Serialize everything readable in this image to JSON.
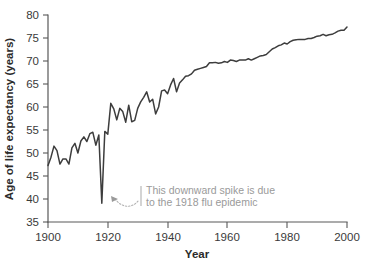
{
  "chart_data": {
    "type": "line",
    "title": "",
    "xlabel": "Year",
    "ylabel": "Age of life expectancy (years)",
    "xlim": [
      1900,
      2000
    ],
    "ylim": [
      35,
      80
    ],
    "grid": false,
    "legend": "none",
    "xticks": [
      1900,
      1920,
      1940,
      1960,
      1980,
      2000
    ],
    "yticks": [
      35,
      40,
      45,
      50,
      55,
      60,
      65,
      70,
      75,
      80
    ],
    "xtick_labels": [
      "1900",
      "1920",
      "1940",
      "1960",
      "1980",
      "2000"
    ],
    "ytick_labels": [
      "35",
      "40",
      "45",
      "50",
      "55",
      "60",
      "65",
      "70",
      "75",
      "80"
    ],
    "series": [
      {
        "name": "Life expectancy",
        "color": "#3d3d3d",
        "x": [
          1900,
          1901,
          1902,
          1903,
          1904,
          1905,
          1906,
          1907,
          1908,
          1909,
          1910,
          1911,
          1912,
          1913,
          1914,
          1915,
          1916,
          1917,
          1918,
          1919,
          1920,
          1921,
          1922,
          1923,
          1924,
          1925,
          1926,
          1927,
          1928,
          1929,
          1930,
          1931,
          1932,
          1933,
          1934,
          1935,
          1936,
          1937,
          1938,
          1939,
          1940,
          1941,
          1942,
          1943,
          1944,
          1945,
          1946,
          1947,
          1948,
          1949,
          1950,
          1951,
          1952,
          1953,
          1954,
          1955,
          1956,
          1957,
          1958,
          1959,
          1960,
          1961,
          1962,
          1963,
          1964,
          1965,
          1966,
          1967,
          1968,
          1969,
          1970,
          1971,
          1972,
          1973,
          1974,
          1975,
          1976,
          1977,
          1978,
          1979,
          1980,
          1981,
          1982,
          1983,
          1984,
          1985,
          1986,
          1987,
          1988,
          1989,
          1990,
          1991,
          1992,
          1993,
          1994,
          1995,
          1996,
          1997,
          1998,
          1999,
          2000
        ],
        "y": [
          47.3,
          49.1,
          51.5,
          50.5,
          47.6,
          48.7,
          48.7,
          47.6,
          51.1,
          52.1,
          50.0,
          52.6,
          53.5,
          52.5,
          54.2,
          54.5,
          51.7,
          53.9,
          39.1,
          54.7,
          54.1,
          60.8,
          59.6,
          57.2,
          59.7,
          59.0,
          56.7,
          60.4,
          56.8,
          57.1,
          59.7,
          61.1,
          62.1,
          63.3,
          61.1,
          61.7,
          58.5,
          60.0,
          63.5,
          63.7,
          62.9,
          64.8,
          66.2,
          63.3,
          65.2,
          65.9,
          66.7,
          66.8,
          67.2,
          68.0,
          68.2,
          68.4,
          68.6,
          68.8,
          69.6,
          69.6,
          69.7,
          69.5,
          69.6,
          69.9,
          69.7,
          70.2,
          70.1,
          69.9,
          70.2,
          70.2,
          70.2,
          70.5,
          70.2,
          70.5,
          70.8,
          71.1,
          71.2,
          71.4,
          72.0,
          72.6,
          72.9,
          73.3,
          73.5,
          73.9,
          73.7,
          74.2,
          74.5,
          74.6,
          74.7,
          74.7,
          74.7,
          74.9,
          74.9,
          75.1,
          75.4,
          75.5,
          75.8,
          75.5,
          75.7,
          75.8,
          76.1,
          76.5,
          76.7,
          76.7,
          77.4
        ]
      }
    ],
    "annotations": [
      {
        "name": "flu-epidemic-note",
        "line1": "This downward spike is due",
        "line2": "to the 1918 flu epidemic",
        "color": "#9a9a9a",
        "points_to_year": 1918,
        "points_to_value": 39.1
      }
    ]
  },
  "colors": {
    "line": "#3d3d3d",
    "axis": "#585858",
    "tick_text": "#3a3a3a",
    "annotation": "#9a9a9a",
    "background": "#ffffff"
  }
}
